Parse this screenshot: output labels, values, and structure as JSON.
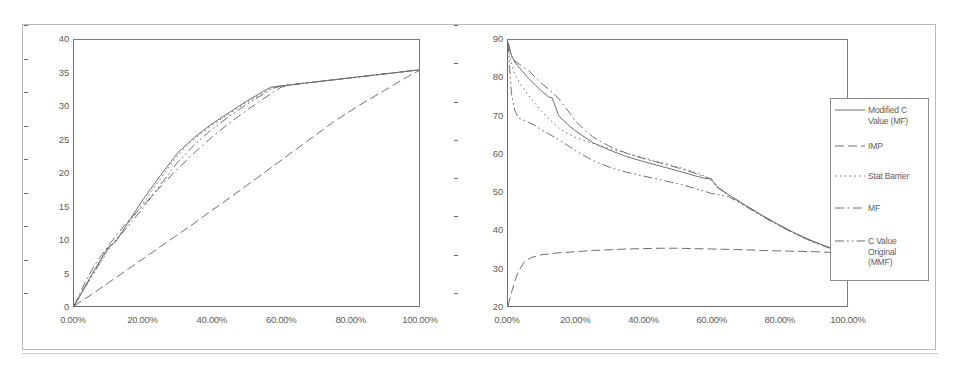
{
  "figure": {
    "panel_count": 2
  },
  "legend": {
    "position": "right",
    "entries": [
      {
        "label": "Modified C\nValue (MF)",
        "dash": "solid",
        "key": "modified_c_value_mf"
      },
      {
        "label": "IMP",
        "dash": "dashed",
        "key": "imp"
      },
      {
        "label": "Stat  Barrier",
        "dash": "dotted",
        "key": "stat_barrier"
      },
      {
        "label": "MF",
        "dash": "dashdot",
        "key": "mf"
      },
      {
        "label": "C Value\nOriginal\n(MMF)",
        "dash": "dashdotdot",
        "key": "c_value_original_mmf"
      }
    ]
  },
  "chart_data": [
    {
      "id": "left-chart",
      "type": "line",
      "title": "",
      "xlabel": "",
      "ylabel": "",
      "xlim": [
        0,
        100
      ],
      "ylim": [
        0,
        40
      ],
      "grid": false,
      "xticklabels": [
        "0.00%",
        "20.00%",
        "40.00%",
        "60.00%",
        "80.00%",
        "100.00%"
      ],
      "xtickvalues": [
        0,
        20,
        40,
        60,
        80,
        100
      ],
      "yticklabels": [
        "0",
        "5",
        "10",
        "15",
        "20",
        "25",
        "30",
        "35",
        "40"
      ],
      "ytickvalues": [
        0,
        5,
        10,
        15,
        20,
        25,
        30,
        35,
        40
      ],
      "series": [
        {
          "name": "Modified C Value (MF)",
          "dash": "solid",
          "x": [
            0,
            5,
            10,
            12,
            15,
            20,
            25,
            30,
            35,
            40,
            45,
            50,
            55,
            57,
            60,
            65,
            70,
            75,
            80,
            85,
            90,
            95,
            100
          ],
          "y": [
            0,
            4.6,
            8.9,
            9.6,
            12.0,
            16.0,
            19.6,
            23.0,
            25.4,
            27.4,
            29.1,
            30.8,
            32.3,
            32.9,
            33.1,
            33.4,
            33.7,
            34.0,
            34.3,
            34.6,
            34.9,
            35.2,
            35.5
          ]
        },
        {
          "name": "IMP",
          "dash": "dashed",
          "x": [
            0,
            5,
            10,
            15,
            20,
            25,
            30,
            35,
            40,
            45,
            50,
            55,
            60,
            65,
            70,
            75,
            80,
            85,
            90,
            95,
            100
          ],
          "y": [
            0,
            1.7,
            3.5,
            5.3,
            7.1,
            8.9,
            10.7,
            12.5,
            14.4,
            16.2,
            18.1,
            20.0,
            21.9,
            23.8,
            25.7,
            27.6,
            29.3,
            30.9,
            32.4,
            34.0,
            35.4
          ]
        },
        {
          "name": "Stat Barrier",
          "dash": "dotted",
          "x": [
            0,
            5,
            10,
            15,
            20,
            25,
            30,
            35,
            40,
            45,
            50,
            55,
            57,
            60,
            65,
            70,
            75,
            80,
            85,
            90,
            95,
            100
          ],
          "y": [
            0,
            4.3,
            8.5,
            11.9,
            15.4,
            19.1,
            22.6,
            25.2,
            27.2,
            28.9,
            30.6,
            32.1,
            32.7,
            33.1,
            33.4,
            33.7,
            34.0,
            34.3,
            34.6,
            34.9,
            35.2,
            35.5
          ]
        },
        {
          "name": "MF",
          "dash": "dashdot",
          "x": [
            0,
            3,
            6,
            10,
            15,
            20,
            25,
            30,
            35,
            40,
            45,
            50,
            55,
            60,
            65,
            70,
            75,
            80,
            85,
            90,
            95,
            100
          ],
          "y": [
            0,
            3.3,
            6.2,
            9.1,
            12.4,
            15.1,
            17.9,
            20.6,
            23.1,
            25.4,
            27.5,
            29.4,
            31.2,
            32.9,
            33.4,
            33.7,
            34.0,
            34.3,
            34.6,
            34.9,
            35.2,
            35.5
          ]
        },
        {
          "name": "C Value Original (MMF)",
          "dash": "dashdotdot",
          "x": [
            0,
            5,
            10,
            15,
            20,
            25,
            30,
            35,
            40,
            45,
            50,
            55,
            57,
            60,
            65,
            70,
            75,
            80,
            85,
            90,
            95,
            100
          ],
          "y": [
            0,
            4.4,
            8.7,
            11.6,
            14.7,
            18.2,
            21.6,
            24.3,
            26.6,
            28.5,
            30.3,
            31.9,
            32.6,
            33.1,
            33.4,
            33.7,
            34.0,
            34.3,
            34.6,
            34.9,
            35.2,
            35.5
          ]
        }
      ]
    },
    {
      "id": "right-chart",
      "type": "line",
      "title": "",
      "xlabel": "",
      "ylabel": "",
      "xlim": [
        0,
        100
      ],
      "ylim": [
        20,
        90
      ],
      "grid": false,
      "xticklabels": [
        "0.00%",
        "20.00%",
        "40.00%",
        "60.00%",
        "80.00%",
        "100.00%"
      ],
      "xtickvalues": [
        0,
        20,
        40,
        60,
        80,
        100
      ],
      "yticklabels": [
        "20",
        "30",
        "40",
        "50",
        "60",
        "70",
        "80",
        "90"
      ],
      "ytickvalues": [
        20,
        30,
        40,
        50,
        60,
        70,
        80,
        90
      ],
      "series": [
        {
          "name": "Modified C Value (MF)",
          "dash": "solid",
          "x": [
            0,
            1,
            2,
            4,
            6,
            8,
            10,
            12,
            13,
            15,
            18,
            20,
            25,
            30,
            35,
            40,
            45,
            50,
            55,
            58,
            60,
            62,
            65,
            70,
            75,
            80,
            85,
            90,
            95,
            100
          ],
          "y": [
            89.5,
            86.0,
            84.2,
            82.0,
            80.0,
            78.2,
            76.5,
            75.0,
            74.8,
            70.0,
            67.5,
            66.0,
            63.0,
            61.0,
            59.3,
            58.0,
            56.8,
            55.6,
            54.3,
            53.6,
            53.4,
            51.0,
            49.3,
            46.5,
            43.8,
            41.3,
            39.0,
            37.0,
            35.3,
            34.0
          ]
        },
        {
          "name": "IMP",
          "dash": "dashed",
          "x": [
            0,
            1,
            2,
            3,
            5,
            7,
            10,
            15,
            20,
            25,
            30,
            35,
            40,
            45,
            50,
            55,
            60,
            65,
            70,
            75,
            80,
            85,
            90,
            95,
            100
          ],
          "y": [
            20.0,
            23.5,
            26.5,
            29.0,
            31.8,
            32.8,
            33.5,
            34.0,
            34.3,
            34.6,
            34.8,
            35.0,
            35.1,
            35.2,
            35.2,
            35.1,
            35.0,
            34.9,
            34.8,
            34.6,
            34.5,
            34.4,
            34.3,
            34.1,
            34.0
          ]
        },
        {
          "name": "Stat Barrier",
          "dash": "dotted",
          "x": [
            0,
            1,
            2,
            4,
            6,
            8,
            10,
            12,
            15,
            18,
            20,
            25,
            30,
            35,
            40,
            45,
            50,
            55,
            58,
            60,
            62,
            65,
            70,
            75,
            80,
            85,
            90,
            95,
            100
          ],
          "y": [
            89.0,
            84.0,
            81.0,
            78.0,
            75.5,
            73.3,
            71.2,
            69.3,
            66.8,
            65.2,
            64.3,
            62.8,
            61.4,
            60.2,
            59.0,
            57.8,
            56.6,
            55.2,
            54.2,
            53.0,
            51.0,
            49.3,
            46.5,
            43.8,
            41.3,
            39.0,
            37.0,
            35.3,
            34.0
          ]
        },
        {
          "name": "MF",
          "dash": "dashdot",
          "x": [
            0,
            1,
            2,
            4,
            6,
            8,
            10,
            13,
            15,
            18,
            20,
            25,
            30,
            35,
            40,
            45,
            50,
            55,
            58,
            60,
            62,
            65,
            70,
            75,
            80,
            85,
            90,
            95,
            100
          ],
          "y": [
            89.0,
            85.8,
            84.5,
            83.2,
            82.0,
            80.2,
            78.5,
            76.3,
            74.5,
            71.0,
            68.5,
            64.5,
            62.0,
            60.2,
            58.8,
            57.6,
            56.4,
            55.0,
            54.0,
            53.4,
            51.2,
            49.3,
            46.5,
            43.8,
            41.3,
            39.0,
            37.0,
            35.3,
            34.0
          ]
        },
        {
          "name": "C Value Original (MMF)",
          "dash": "dashdotdot",
          "x": [
            0,
            1,
            2,
            3,
            5,
            8,
            10,
            13,
            15,
            18,
            20,
            25,
            30,
            35,
            40,
            45,
            50,
            55,
            58,
            60,
            62,
            65,
            70,
            75,
            80,
            85,
            90,
            95,
            100
          ],
          "y": [
            89.0,
            76.0,
            71.5,
            69.5,
            68.8,
            67.5,
            66.3,
            64.8,
            63.7,
            62.0,
            60.8,
            58.3,
            56.5,
            55.2,
            54.2,
            53.2,
            52.2,
            51.0,
            50.2,
            49.6,
            49.3,
            48.8,
            46.3,
            43.6,
            41.1,
            38.8,
            36.8,
            35.2,
            34.0
          ]
        }
      ]
    }
  ]
}
